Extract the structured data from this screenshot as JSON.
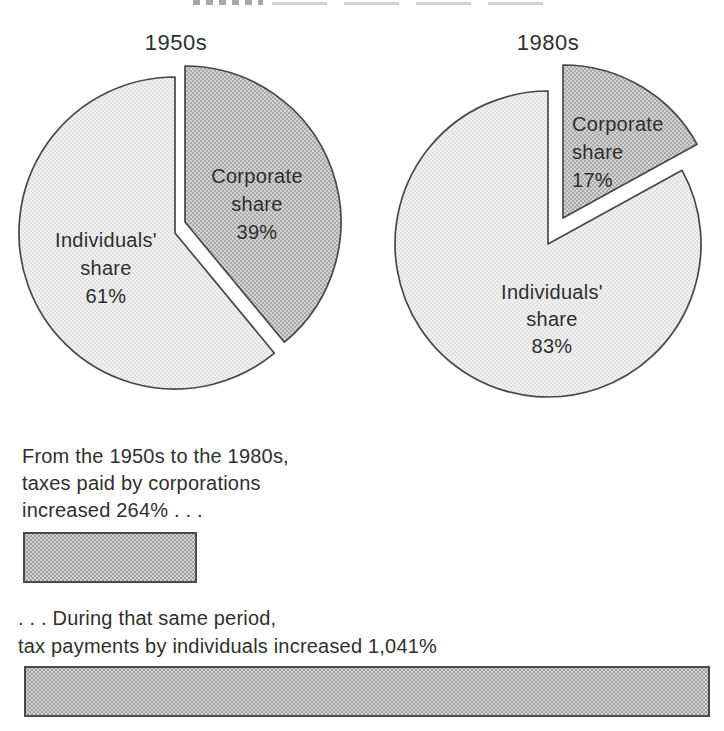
{
  "figure": {
    "cropped_top_title_visible": true,
    "description_visible_text_only": true
  },
  "colors": {
    "background": "#ffffff",
    "text": "#2f2f2f",
    "outline": "#484848",
    "corporate_fill_avg": "#c3c3c3",
    "individuals_fill_avg": "#e9e9e9",
    "bar_fill_avg": "#cccccc"
  },
  "chart_data": [
    {
      "type": "pie",
      "title": "1950s",
      "unit": "%",
      "legend_position": "none",
      "labels_on_slices": true,
      "slices": [
        {
          "id": "corporate-share",
          "name": "Corporate share",
          "pct": 39,
          "display_lines": [
            "Corporate",
            "share",
            "39%"
          ],
          "fill_style": "ht-dark",
          "avg_color": "#c3c3c3",
          "exploded": true
        },
        {
          "id": "individuals-share",
          "name": "Individuals' share",
          "pct": 61,
          "display_lines": [
            "Individuals'",
            "share",
            "61%"
          ],
          "fill_style": "ht-light",
          "avg_color": "#e9e9e9",
          "exploded": false
        }
      ]
    },
    {
      "type": "pie",
      "title": "1980s",
      "unit": "%",
      "legend_position": "none",
      "labels_on_slices": true,
      "slices": [
        {
          "id": "corporate-share",
          "name": "Corporate share",
          "pct": 17,
          "display_lines": [
            "Corporate",
            "share",
            "17%"
          ],
          "fill_style": "ht-dark",
          "avg_color": "#c3c3c3",
          "exploded": true
        },
        {
          "id": "individuals-share",
          "name": "Individuals' share",
          "pct": 83,
          "display_lines": [
            "Individuals'",
            "share",
            "83%"
          ],
          "fill_style": "ht-light",
          "avg_color": "#e9e9e9",
          "exploded": false
        }
      ]
    },
    {
      "type": "bar",
      "orientation": "horizontal",
      "unit": "% increase",
      "categories": [
        "taxes paid by corporations",
        "tax payments by individuals"
      ],
      "values": [
        264,
        1041
      ],
      "bars": [
        {
          "value": 264,
          "label_lines": [
            "From the 1950s to the 1980s,",
            "taxes paid by corporations",
            "increased 264% . . ."
          ]
        },
        {
          "value": 1041,
          "label_lines": [
            ". . . During that same period,",
            "tax payments by individuals increased 1,041%"
          ]
        }
      ]
    }
  ]
}
